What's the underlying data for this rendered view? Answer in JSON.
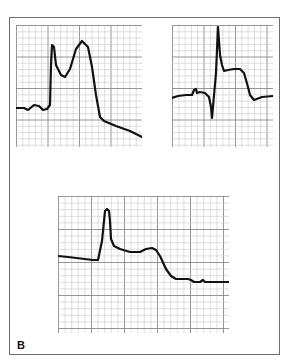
{
  "figure": {
    "label": "B",
    "frame_color": "#6e6e6e",
    "grid_minor_color": "#c8c8c8",
    "grid_major_color": "#8a8a8a",
    "trace_color": "#111111"
  },
  "panels": [
    {
      "name": "ecg-panel-top-left",
      "x": 16,
      "y": 25,
      "w": 126,
      "h": 122,
      "minor": 6.3,
      "major_every": 5,
      "trace": "0,83 8,83 12,85 18,80 23,81 27,85 31,84 34,80 35,40 36,20 38,22 40,40 45,50 49,52 54,44 60,24 66,16 72,22 76,42 80,70 84,92 88,96 100,101 114,106 126,112"
    },
    {
      "name": "ecg-panel-top-right",
      "x": 172,
      "y": 25,
      "w": 101,
      "h": 122,
      "minor": 6.3,
      "major_every": 5,
      "trace": "0,73 6,71 14,70 20,70 22,65 24,64 25,68 28,67 33,68 37,72 39,82 40,93 44,48 46,2 48,30 50,40 52,46 56,45 62,44 68,44 72,48 76,62 78,70 82,75 90,72 101,71"
    },
    {
      "name": "ecg-panel-bottom",
      "x": 58,
      "y": 196,
      "w": 171,
      "h": 137,
      "minor": 6.6,
      "major_every": 5,
      "trace": "0,60 10,61 35,64 40,64 44,45 46,25 47,15 49,13 51,15 52,25 53,43 56,50 62,53 72,56 82,56 88,53 94,52 98,54 102,60 108,73 113,80 118,83 130,83 133,84 136,86 142,86 145,84 147,86 150,86 171,86"
    }
  ]
}
